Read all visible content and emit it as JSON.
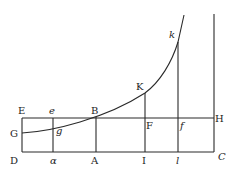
{
  "diagram": {
    "type": "geometric-figure",
    "colors": {
      "ink": "#2a2a2a",
      "background": "#ffffff"
    },
    "labels": {
      "E": "E",
      "e": "e",
      "B": "B",
      "H": "H",
      "G": "G",
      "g": "g",
      "F": "F",
      "f": "f",
      "K": "K",
      "k": "k",
      "D": "D",
      "a": "α",
      "A": "A",
      "I": "I",
      "l": "l",
      "C": "C"
    }
  }
}
